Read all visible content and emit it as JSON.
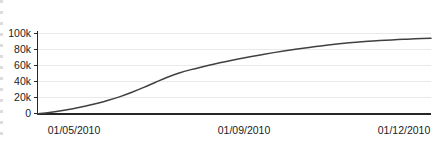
{
  "chart_data": {
    "type": "line",
    "title": "",
    "subtitle": "",
    "xlabel": "",
    "ylabel": "",
    "grid": true,
    "legend": false,
    "legend_position": "none",
    "line_color": "#404040",
    "axis_color": "#262626",
    "grid_color": "#e8e8e8",
    "background_color": "#ffffff",
    "xlim": [
      0,
      100
    ],
    "ylim": [
      0,
      105000
    ],
    "y_ticks": [
      0,
      20000,
      40000,
      60000,
      80000,
      100000
    ],
    "y_tick_labels": [
      "0",
      "20k",
      "40k",
      "60k",
      "80k",
      "100k"
    ],
    "x_ticks": [
      5.0,
      52.5,
      96.5
    ],
    "x_tick_labels": [
      "01/05/2010",
      "01/09/2010",
      "01/12/2010"
    ],
    "categories": [
      "01/05/2010",
      "01/09/2010",
      "01/12/2010"
    ],
    "series": [
      {
        "name": "cumulative",
        "x": [
          0,
          3,
          6,
          9,
          12,
          15,
          18,
          21,
          24,
          27,
          30,
          33,
          36,
          39,
          42,
          45,
          48,
          51,
          54,
          57,
          60,
          63,
          66,
          69,
          72,
          75,
          78,
          81,
          84,
          87,
          90,
          93,
          96,
          100
        ],
        "values": [
          400,
          2000,
          4200,
          6800,
          9800,
          13200,
          17200,
          21800,
          27200,
          33200,
          39600,
          45800,
          51000,
          55200,
          58800,
          62200,
          65400,
          68400,
          71200,
          73800,
          76300,
          78600,
          80700,
          82700,
          84600,
          86400,
          88000,
          89300,
          90400,
          91300,
          92100,
          92800,
          93400,
          94000
        ]
      }
    ]
  },
  "axes": {
    "y_labels": [
      "100k",
      "80k",
      "60k",
      "40k",
      "20k",
      "0"
    ],
    "x_labels": [
      "01/05/2010",
      "01/09/2010",
      "01/12/2010"
    ]
  }
}
